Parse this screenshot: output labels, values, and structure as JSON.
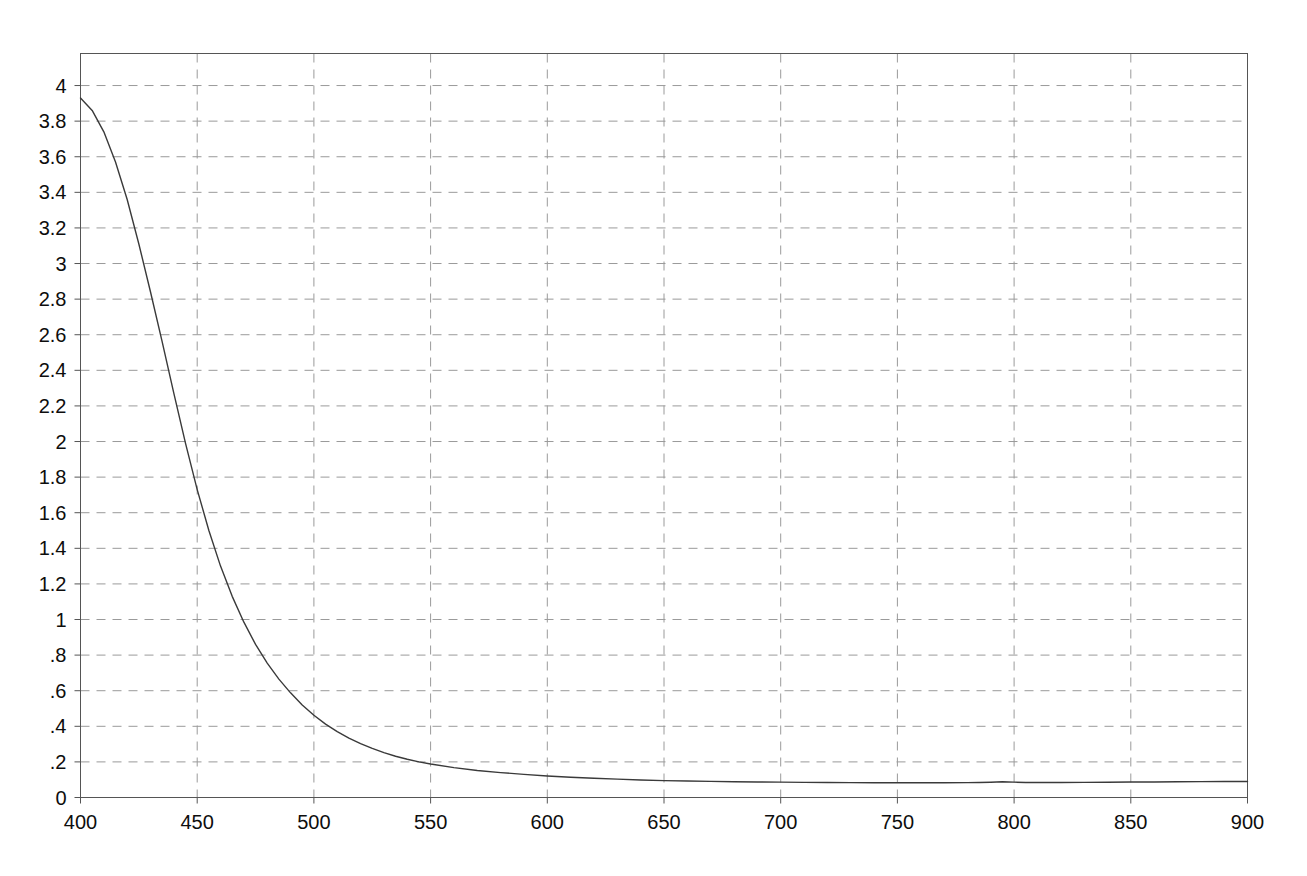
{
  "chart_data": {
    "type": "line",
    "title": "",
    "subtitle": "",
    "xlabel": "",
    "ylabel": "",
    "xlim": [
      400,
      900
    ],
    "ylim": [
      0,
      4.18
    ],
    "grid": true,
    "legend": false,
    "x_ticks": [
      400,
      450,
      500,
      550,
      600,
      650,
      700,
      750,
      800,
      850,
      900
    ],
    "x_tick_labels": [
      "400",
      "450",
      "500",
      "550",
      "600",
      "650",
      "700",
      "750",
      "800",
      "850",
      "900"
    ],
    "y_ticks": [
      0,
      0.2,
      0.4,
      0.6,
      0.8,
      1,
      1.2,
      1.4,
      1.6,
      1.8,
      2,
      2.2,
      2.4,
      2.6,
      2.8,
      3,
      3.2,
      3.4,
      3.6,
      3.8,
      4
    ],
    "y_tick_labels": [
      "0",
      ".2",
      ".4",
      ".6",
      ".8",
      "1",
      "1.2",
      "1.4",
      "1.6",
      "1.8",
      "2",
      "2.2",
      "2.4",
      "2.6",
      "2.8",
      "3",
      "3.2",
      "3.4",
      "3.6",
      "3.8",
      "4"
    ],
    "line_color": "#3a3a3a",
    "grid_color": "#9a9a9a",
    "axis_color": "#555555",
    "series": [
      {
        "name": "spectrum",
        "x": [
          400,
          405,
          410,
          415,
          420,
          425,
          430,
          435,
          440,
          445,
          450,
          455,
          460,
          465,
          470,
          475,
          480,
          485,
          490,
          495,
          500,
          505,
          510,
          515,
          520,
          525,
          530,
          535,
          540,
          545,
          550,
          560,
          570,
          580,
          590,
          600,
          610,
          620,
          630,
          640,
          650,
          660,
          670,
          680,
          690,
          700,
          710,
          720,
          730,
          740,
          750,
          760,
          770,
          780,
          785,
          790,
          795,
          800,
          805,
          810,
          820,
          830,
          840,
          850,
          860,
          870,
          880,
          890,
          900
        ],
        "y": [
          3.93,
          3.86,
          3.74,
          3.57,
          3.36,
          3.11,
          2.84,
          2.56,
          2.27,
          1.99,
          1.73,
          1.5,
          1.3,
          1.13,
          0.985,
          0.86,
          0.755,
          0.665,
          0.588,
          0.52,
          0.462,
          0.412,
          0.37,
          0.334,
          0.303,
          0.276,
          0.252,
          0.232,
          0.215,
          0.2,
          0.188,
          0.168,
          0.152,
          0.14,
          0.13,
          0.121,
          0.114,
          0.108,
          0.103,
          0.0985,
          0.095,
          0.0925,
          0.0905,
          0.0888,
          0.0875,
          0.0862,
          0.085,
          0.084,
          0.0835,
          0.083,
          0.0828,
          0.0828,
          0.083,
          0.0835,
          0.0845,
          0.086,
          0.0885,
          0.0862,
          0.0845,
          0.0842,
          0.0845,
          0.0852,
          0.086,
          0.0868,
          0.0875,
          0.0882,
          0.089,
          0.0895,
          0.09
        ]
      }
    ]
  }
}
